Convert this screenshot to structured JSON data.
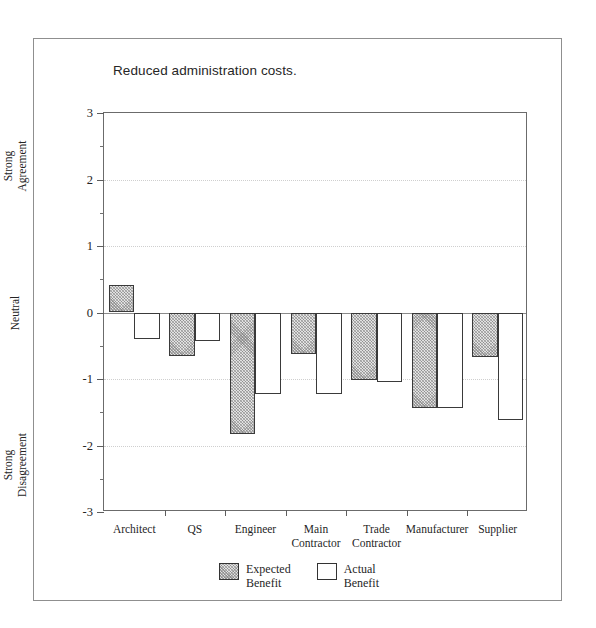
{
  "figure": {
    "title": "Reduced administration costs."
  },
  "chart_data": {
    "type": "bar",
    "title": "Reduced administration costs.",
    "xlabel": "",
    "ylabel": "",
    "ylim": [
      -3,
      3
    ],
    "grid": true,
    "orientation": "vertical",
    "grouping": "grouped",
    "categories": [
      "Architect",
      "QS",
      "Engineer",
      "Main\nContractor",
      "Trade\nContractor",
      "Manufacturer",
      "Supplier"
    ],
    "series": [
      {
        "name": "Expected Benefit",
        "fill": "hatched-gray",
        "values": [
          0.42,
          -0.65,
          -1.82,
          -0.63,
          -1.02,
          -1.43,
          -0.67
        ]
      },
      {
        "name": "Actual Benefit",
        "fill": "white",
        "values": [
          -0.4,
          -0.43,
          -1.22,
          -1.22,
          -1.05,
          -1.43,
          -1.62
        ]
      }
    ],
    "y_ticks_major": [
      3,
      2,
      1,
      0,
      -1,
      -2,
      -3
    ],
    "y_tick_labels": [
      "3",
      "2",
      "1",
      "0",
      "-1",
      "-2",
      "-3"
    ],
    "y_ticks_minor": [
      2.5,
      1.5,
      0.5,
      -0.5,
      -1.5,
      -2.5
    ],
    "y_axis_captions": [
      {
        "text": "Strong\nAgreement",
        "value": 2.2
      },
      {
        "text": "Neutral",
        "value": 0.0
      },
      {
        "text": "Strong\nDisagreement",
        "value": -2.3
      }
    ],
    "legend": {
      "position": "bottom-center",
      "entries": [
        {
          "label": "Expected\nBenefit",
          "fill": "hatched-gray"
        },
        {
          "label": "Actual\nBenefit",
          "fill": "white"
        }
      ]
    },
    "colors": {
      "bar_outline": "#3a3a3a",
      "expected_fill": "#e2e2e2",
      "actual_fill": "#ffffff",
      "axis": "#6b6b6b",
      "gridline": "#cfcfcf",
      "zero_line": "#8a8a8a",
      "background": "#ffffff"
    }
  }
}
